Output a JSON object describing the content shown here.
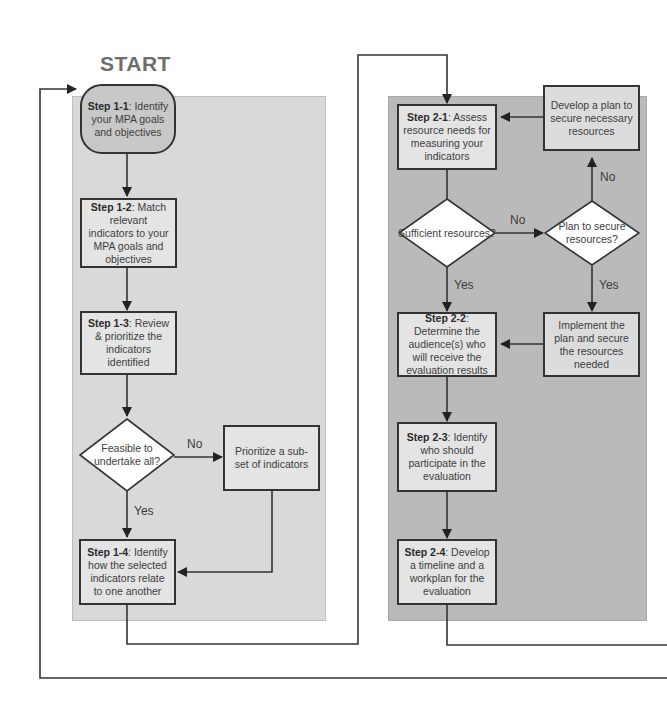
{
  "start_label": "START",
  "phase1": {
    "step_1_1": {
      "bold": "Step 1-1",
      "text": ": Identify your MPA goals and objectives"
    },
    "step_1_2": {
      "bold": "Step 1-2",
      "text": ": Match relevant indicators to your MPA goals and objectives"
    },
    "step_1_3": {
      "bold": "Step 1-3",
      "text": ": Review & prioritize the indicators identified"
    },
    "decision_feasible": "Feasible to undertake all?",
    "prioritize_subset": "Prioritize a sub-set of indicators",
    "step_1_4": {
      "bold": "Step 1-4",
      "text": ": Identify how the selected indicators relate to one another"
    },
    "label_no": "No",
    "label_yes": "Yes"
  },
  "phase2": {
    "step_2_1": {
      "bold": "Step 2-1",
      "text": ": Assess resource needs for measuring your indicators"
    },
    "develop_plan": "Develop a plan to secure necessary resources",
    "decision_sufficient": "Sufficient resources?",
    "decision_plan": "Plan to secure resources?",
    "step_2_2": {
      "bold": "Step 2-2",
      "text": ": Determine the audience(s) who will receive the evaluation results"
    },
    "implement_plan": "Implement the plan and secure the resources needed",
    "step_2_3": {
      "bold": "Step 2-3",
      "text": ": Identify who should participate in the evaluation"
    },
    "step_2_4": {
      "bold": "Step 2-4",
      "text": ": Develop a timeline and a workplan for the evaluation"
    },
    "label_no_1": "No",
    "label_no_2": "No",
    "label_yes_1": "Yes",
    "label_yes_2": "Yes"
  },
  "colors": {
    "panel1_bg": "#d9d9d9",
    "panel2_bg": "#bababa",
    "box_bg": "#e4e4e4",
    "start_box_bg": "#c8c8c8",
    "line": "#333333",
    "start_text": "#6e6e6e"
  }
}
